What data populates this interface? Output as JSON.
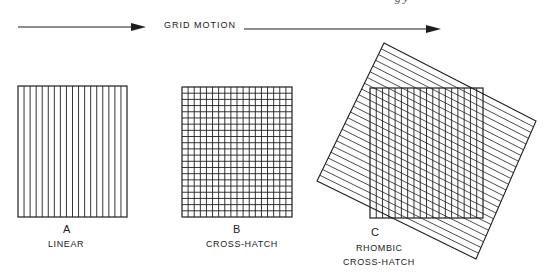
{
  "header": {
    "motion_label": "GRID MOTION",
    "cutoff_caption": "g            y",
    "arrows": [
      {
        "x1": 18,
        "x2": 146,
        "y": 27
      },
      {
        "x1": 244,
        "x2": 441,
        "y": 29
      }
    ]
  },
  "panels": [
    {
      "id": "A",
      "letter": "A",
      "caption": "LINEAR",
      "type": "linear",
      "box": {
        "x": 18,
        "y": 86,
        "w": 109,
        "h": 131
      },
      "vertical_lines": 18,
      "horizontal_lines": 0
    },
    {
      "id": "B",
      "letter": "B",
      "caption": "CROSS-HATCH",
      "type": "cross-hatch",
      "box": {
        "x": 182,
        "y": 87,
        "w": 110,
        "h": 130
      },
      "vertical_lines": 18,
      "horizontal_lines": 21
    },
    {
      "id": "C",
      "letter": "C",
      "caption_line1": "RHOMBIC",
      "caption_line2": "CROSS-HATCH",
      "type": "rhombic-cross-hatch",
      "box": {
        "x": 370,
        "y": 88,
        "w": 113,
        "h": 130
      },
      "vertical_lines": 18,
      "rotated_square": {
        "corners": [
          [
            384,
            43
          ],
          [
            536,
            121
          ],
          [
            476,
            259
          ],
          [
            317,
            181
          ]
        ],
        "line_count": 24
      }
    }
  ],
  "colors": {
    "ink": "#1e1e1e",
    "background": "#ffffff"
  }
}
